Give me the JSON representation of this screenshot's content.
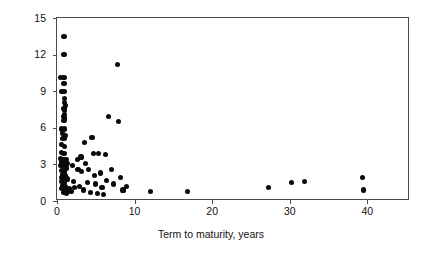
{
  "chart_data": {
    "type": "scatter",
    "title": "",
    "xlabel": "Term to maturity, years",
    "ylabel": "$ (billions)",
    "xlim": [
      0,
      45.5
    ],
    "ylim": [
      0,
      15
    ],
    "xticks": [
      0,
      10,
      20,
      30,
      40
    ],
    "yticks": [
      0,
      3,
      6,
      9,
      12,
      15
    ],
    "xticklabels": [
      "0",
      "10",
      "20",
      "30",
      "40"
    ],
    "yticklabels": [
      "0",
      "3",
      "6",
      "9",
      "12",
      "15"
    ],
    "grid": false,
    "legend": null,
    "marker": "filled-circle",
    "marker_color": "#0a0a0a",
    "frame_color": "#4a4a4a",
    "background_color": "#ffffff",
    "points": [
      [
        0.9,
        13.5
      ],
      [
        0.9,
        12.0
      ],
      [
        0.5,
        10.1
      ],
      [
        0.9,
        10.1
      ],
      [
        0.9,
        9.6
      ],
      [
        0.6,
        9.0
      ],
      [
        0.9,
        9.0
      ],
      [
        1.0,
        8.4
      ],
      [
        1.0,
        8.1
      ],
      [
        1.1,
        7.8
      ],
      [
        0.9,
        7.6
      ],
      [
        1.0,
        7.4
      ],
      [
        1.0,
        7.1
      ],
      [
        0.8,
        6.9
      ],
      [
        1.0,
        6.8
      ],
      [
        0.9,
        6.6
      ],
      [
        0.6,
        5.9
      ],
      [
        1.0,
        5.9
      ],
      [
        0.7,
        5.5
      ],
      [
        1.1,
        5.4
      ],
      [
        0.7,
        5.1
      ],
      [
        1.0,
        5.1
      ],
      [
        0.6,
        4.6
      ],
      [
        1.0,
        4.5
      ],
      [
        0.6,
        4.0
      ],
      [
        0.9,
        3.9
      ],
      [
        0.5,
        3.5
      ],
      [
        0.9,
        3.4
      ],
      [
        1.2,
        3.4
      ],
      [
        0.6,
        3.2
      ],
      [
        1.0,
        3.1
      ],
      [
        1.3,
        3.1
      ],
      [
        0.5,
        2.9
      ],
      [
        0.9,
        2.8
      ],
      [
        1.2,
        2.7
      ],
      [
        0.6,
        2.5
      ],
      [
        1.0,
        2.4
      ],
      [
        0.7,
        2.2
      ],
      [
        1.1,
        2.1
      ],
      [
        0.6,
        1.9
      ],
      [
        1.0,
        1.8
      ],
      [
        1.3,
        1.8
      ],
      [
        0.6,
        1.6
      ],
      [
        1.0,
        1.5
      ],
      [
        0.7,
        1.3
      ],
      [
        1.1,
        1.2
      ],
      [
        0.6,
        1.0
      ],
      [
        1.0,
        0.9
      ],
      [
        1.4,
        0.9
      ],
      [
        0.8,
        0.7
      ],
      [
        1.2,
        0.6
      ],
      [
        1.6,
        1.0
      ],
      [
        1.8,
        0.8
      ],
      [
        2.0,
        2.9
      ],
      [
        2.1,
        1.6
      ],
      [
        2.3,
        1.1
      ],
      [
        2.6,
        3.4
      ],
      [
        2.7,
        2.6
      ],
      [
        2.9,
        1.2
      ],
      [
        3.1,
        3.6
      ],
      [
        3.2,
        2.4
      ],
      [
        3.4,
        0.9
      ],
      [
        3.5,
        4.8
      ],
      [
        3.7,
        3.1
      ],
      [
        3.9,
        1.5
      ],
      [
        4.1,
        2.6
      ],
      [
        4.3,
        0.7
      ],
      [
        4.5,
        5.2
      ],
      [
        4.7,
        3.9
      ],
      [
        4.8,
        2.1
      ],
      [
        5.0,
        1.4
      ],
      [
        5.2,
        0.6
      ],
      [
        5.4,
        3.9
      ],
      [
        5.6,
        2.3
      ],
      [
        5.8,
        1.1
      ],
      [
        6.0,
        0.5
      ],
      [
        6.2,
        3.8
      ],
      [
        6.4,
        1.7
      ],
      [
        6.6,
        6.9
      ],
      [
        7.0,
        2.6
      ],
      [
        7.3,
        1.4
      ],
      [
        7.8,
        11.2
      ],
      [
        7.9,
        6.5
      ],
      [
        8.2,
        1.9
      ],
      [
        8.5,
        0.9
      ],
      [
        9.0,
        1.2
      ],
      [
        12.0,
        0.8
      ],
      [
        16.8,
        0.8
      ],
      [
        27.3,
        1.1
      ],
      [
        30.2,
        1.5
      ],
      [
        31.9,
        1.6
      ],
      [
        39.4,
        1.9
      ],
      [
        39.5,
        0.9
      ]
    ]
  }
}
